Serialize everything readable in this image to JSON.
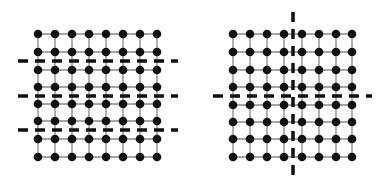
{
  "diagram": {
    "colors": {
      "node": "#111111",
      "edge": "#888888",
      "cut": "#111111",
      "background": "#ffffff"
    },
    "panels": [
      {
        "name": "left-lattice",
        "columns": [
          38,
          55,
          72,
          89,
          106,
          123,
          140,
          157
        ],
        "rows": [
          34,
          52,
          70,
          87,
          104,
          121,
          139,
          157
        ],
        "horizontal_cuts": [
          61,
          96,
          130
        ],
        "vertical_cuts": [],
        "cut_extent_x": [
          18,
          178
        ],
        "cut_extent_y": [
          20,
          170
        ]
      },
      {
        "name": "right-lattice",
        "columns": [
          233,
          250,
          267,
          284,
          302,
          319,
          336,
          352
        ],
        "rows": [
          34,
          52,
          70,
          87,
          105,
          122,
          139,
          157
        ],
        "horizontal_cuts": [
          96
        ],
        "vertical_cuts": [
          293
        ],
        "cut_extent_x": [
          213,
          372
        ],
        "cut_extent_y": [
          12,
          178
        ]
      }
    ]
  }
}
